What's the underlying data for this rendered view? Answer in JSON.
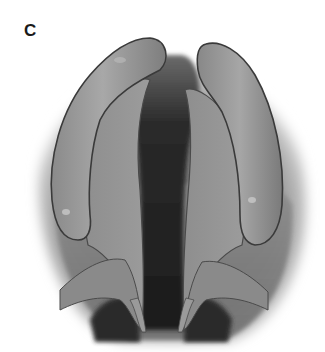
{
  "figure": {
    "panel_label": "C",
    "illustration": {
      "subject": "anatomical-illustration",
      "style": "grayscale-shaded-drawing",
      "structures": [
        {
          "name": "left-fold",
          "side": "left"
        },
        {
          "name": "right-fold",
          "side": "right"
        },
        {
          "name": "central-dark-cleft",
          "side": "center"
        },
        {
          "name": "lower-left-process",
          "side": "left"
        },
        {
          "name": "lower-right-process",
          "side": "right"
        }
      ]
    },
    "colors": {
      "background": "#ffffff",
      "tissue_light": "#a9a9a9",
      "tissue_mid": "#8a8a8a",
      "tissue_dark": "#5e5e5e",
      "cavity": "#222222",
      "outline": "#3a3a3a",
      "label": "#1a1a1a"
    }
  }
}
